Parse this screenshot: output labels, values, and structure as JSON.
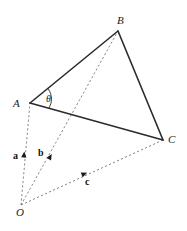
{
  "figure": {
    "kind": "vector-triangle-diagram",
    "background_color": "#ffffff",
    "solid_stroke_color": "#2b2b2b",
    "dashed_stroke_color": "#7a7a7a",
    "label_color": "#1a1a1a",
    "width": 187,
    "height": 231
  },
  "points": {
    "origin": {
      "label": "O",
      "x": 21,
      "y": 205,
      "label_x": 16,
      "label_y": 216
    },
    "a_tip": {
      "label": "A",
      "x": 30,
      "y": 103,
      "label_x": 13,
      "label_y": 107
    },
    "b_tip": {
      "label": "B",
      "x": 118,
      "y": 31,
      "label_x": 117,
      "label_y": 24
    },
    "c_tip": {
      "label": "C",
      "x": 163,
      "y": 140,
      "label_x": 168,
      "label_y": 143
    }
  },
  "angle": {
    "label": "θ",
    "at_vertex": "A",
    "label_x": 46,
    "label_y": 102
  },
  "vectors": [
    {
      "label": "a",
      "from": "O",
      "to": "A",
      "label_x": 13,
      "label_y": 159,
      "arrow_x": 24,
      "arrow_y": 155,
      "arrow_rotation": -85
    },
    {
      "label": "b",
      "from": "O",
      "to": "B",
      "label_x": 38,
      "label_y": 156,
      "arrow_x": 50,
      "arrow_y": 157,
      "arrow_rotation": -60
    },
    {
      "label": "c",
      "from": "O",
      "to": "C",
      "label_x": 85,
      "label_y": 185,
      "arrow_x": 84,
      "arrow_y": 174,
      "arrow_rotation": -22
    }
  ],
  "edges": [
    {
      "name": "AB",
      "from": "A",
      "to": "B",
      "style": "solid"
    },
    {
      "name": "BC",
      "from": "B",
      "to": "C",
      "style": "solid"
    },
    {
      "name": "AC",
      "from": "A",
      "to": "C",
      "style": "solid"
    },
    {
      "name": "OA",
      "from": "O",
      "to": "A",
      "style": "dashed"
    },
    {
      "name": "OB",
      "from": "O",
      "to": "B",
      "style": "dashed"
    },
    {
      "name": "OC",
      "from": "O",
      "to": "C",
      "style": "dashed"
    }
  ]
}
